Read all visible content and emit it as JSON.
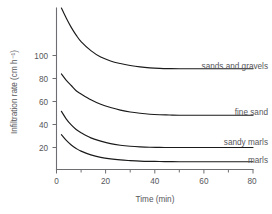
{
  "chart_data": {
    "type": "line",
    "title": "",
    "xlabel": "Time (min)",
    "ylabel": "Infiltration rate (cm h⁻¹)",
    "xlim": [
      0,
      80
    ],
    "ylim": [
      0,
      125
    ],
    "grid": false,
    "legend_position": "inline-right",
    "xticks": [
      0,
      20,
      40,
      60,
      80
    ],
    "xtick_labels": [
      "0",
      "20",
      "40",
      "60",
      "80"
    ],
    "xminor_ticks": [
      10,
      30,
      50,
      70
    ],
    "yticks": [
      20,
      40,
      60,
      80,
      100
    ],
    "ytick_labels": [
      "20",
      "40",
      "60",
      "80",
      "100"
    ],
    "series": [
      {
        "name": "sands and gravels",
        "label": "sands and gravels",
        "initial_value": 125,
        "final_value": 78,
        "x": [
          2,
          4,
          6,
          8,
          10,
          14,
          18,
          22,
          26,
          30,
          34,
          38,
          42,
          46,
          50,
          60,
          70,
          80
        ],
        "values": [
          125,
          117,
          110,
          104,
          99,
          92,
          87,
          84,
          82,
          80.5,
          79.4,
          78.7,
          78.3,
          78.1,
          78,
          78,
          78,
          78
        ]
      },
      {
        "name": "fine sand",
        "label": "fine sand",
        "initial_value": 74,
        "final_value": 42,
        "x": [
          2,
          4,
          6,
          8,
          10,
          14,
          18,
          22,
          26,
          30,
          34,
          38,
          42,
          46,
          50,
          60,
          70,
          80
        ],
        "values": [
          74,
          69,
          65,
          61,
          58.5,
          54,
          50.5,
          48,
          46,
          44.5,
          43.5,
          42.8,
          42.4,
          42.2,
          42,
          42,
          42,
          42
        ]
      },
      {
        "name": "sandy marls",
        "label": "sandy marls",
        "initial_value": 45,
        "final_value": 17,
        "x": [
          2,
          4,
          6,
          8,
          10,
          14,
          18,
          22,
          26,
          30,
          34,
          38,
          42,
          46,
          50,
          60,
          70,
          80
        ],
        "values": [
          45,
          39,
          34.5,
          31,
          28.5,
          24.5,
          22,
          20,
          18.8,
          18,
          17.5,
          17.2,
          17.1,
          17,
          17,
          17,
          17,
          17
        ]
      },
      {
        "name": "marls",
        "label": "marls",
        "initial_value": 27,
        "final_value": 6,
        "x": [
          2,
          4,
          6,
          8,
          10,
          14,
          18,
          22,
          26,
          30,
          34,
          38,
          42,
          46,
          50,
          60,
          70,
          80
        ],
        "values": [
          27,
          22.5,
          19,
          16.3,
          14.2,
          11.3,
          9.4,
          8.2,
          7.4,
          6.9,
          6.5,
          6.3,
          6.2,
          6.1,
          6,
          6,
          6,
          6
        ]
      }
    ],
    "colors": {
      "curve": "#1a1a1a",
      "axis": "#6e6e72",
      "text": "#56565a",
      "background": "#ffffff"
    }
  }
}
